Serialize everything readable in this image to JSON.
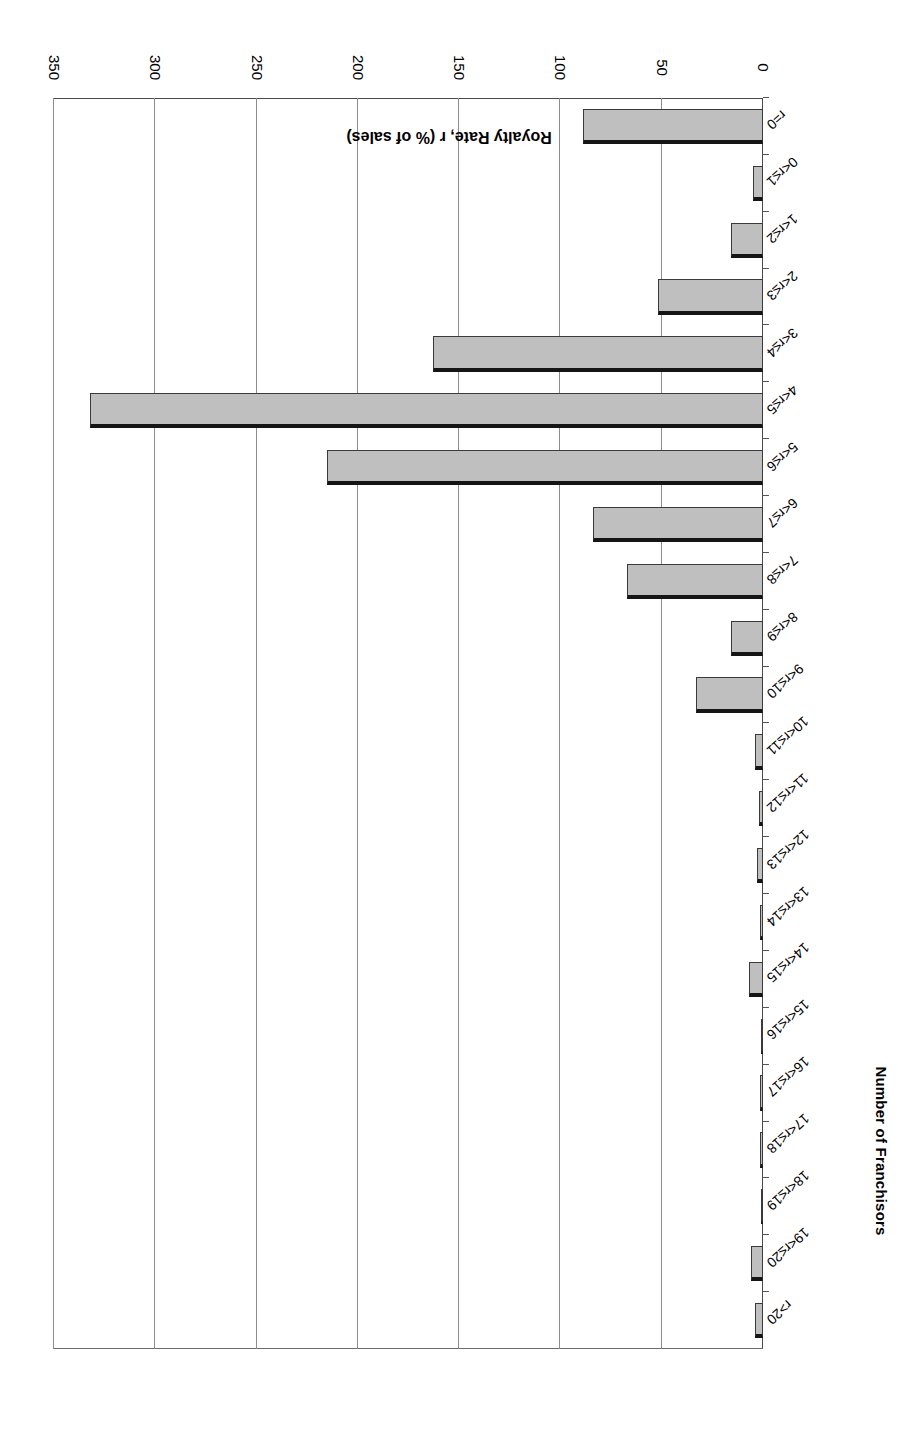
{
  "chart_data": {
    "type": "bar",
    "orientation": "horizontal-categories-on-x",
    "title": "",
    "xlabel": "Royalty Rate, r (% of sales)",
    "ylabel": "Number of Franchisors",
    "ylim": [
      0,
      350
    ],
    "yticks": [
      0,
      50,
      100,
      150,
      200,
      250,
      300,
      350
    ],
    "ytick_labels": [
      "0",
      "50",
      "100",
      "150",
      "200",
      "250",
      "300",
      "350"
    ],
    "grid": true,
    "legend": "none",
    "categories": [
      "r=0",
      "0<r≤1",
      "1<r≤2",
      "2<r≤3",
      "3<r≤4",
      "4<r≤5",
      "5<r≤6",
      "6<r≤7",
      "7<r≤8",
      "8<r≤9",
      "9<r≤10",
      "10<r≤11",
      "11<r≤12",
      "12<r≤13",
      "13<r≤14",
      "14<r≤15",
      "15<r≤16",
      "16<r≤17",
      "17<r≤18",
      "18<r≤19",
      "19<r≤20",
      "r>20"
    ],
    "values": [
      89,
      5,
      16,
      52,
      163,
      332,
      215,
      84,
      67,
      16,
      33,
      4,
      2,
      3,
      1,
      7,
      0,
      1,
      1,
      0,
      6,
      4
    ]
  },
  "axes": {
    "value_axis_title": "Number of Franchisors",
    "category_axis_title": "Royalty Rate, r (% of sales)"
  },
  "style": {
    "bar_fill": "#bfbfbf",
    "bar_border": "#3a3a3a",
    "bar_top_cap": "#151515",
    "grid_color": "#8d8d8d",
    "axis_color": "#4a4a4a",
    "background": "#ffffff"
  }
}
